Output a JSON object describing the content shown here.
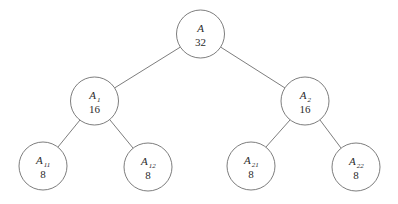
{
  "diagram": {
    "type": "binary-tree",
    "title": "",
    "background_color": "#ffffff",
    "stroke_color": "#6e6e6e",
    "text_color": "#2b2b2b",
    "nodes": [
      {
        "id": "root",
        "label": "A",
        "subscript": "",
        "value": "32",
        "cx": 200.5,
        "cy": 34,
        "r": 24
      },
      {
        "id": "a1",
        "label": "A",
        "subscript": "1",
        "value": "16",
        "cx": 94.5,
        "cy": 101,
        "r": 24
      },
      {
        "id": "a2",
        "label": "A",
        "subscript": "2",
        "value": "16",
        "cx": 305,
        "cy": 101,
        "r": 24
      },
      {
        "id": "a11",
        "label": "A",
        "subscript": "11",
        "value": "8",
        "cx": 43,
        "cy": 166,
        "r": 24
      },
      {
        "id": "a12",
        "label": "A",
        "subscript": "12",
        "value": "8",
        "cx": 148,
        "cy": 167,
        "r": 24
      },
      {
        "id": "a21",
        "label": "A",
        "subscript": "21",
        "value": "8",
        "cx": 251,
        "cy": 166,
        "r": 24
      },
      {
        "id": "a22",
        "label": "A",
        "subscript": "22",
        "value": "8",
        "cx": 356,
        "cy": 167,
        "r": 24
      }
    ],
    "edges": [
      {
        "id": "edge-root-a1",
        "from": "root",
        "to": "a1",
        "x1": 180.5,
        "y1": 47,
        "x2": 114.5,
        "y2": 88
      },
      {
        "id": "edge-root-a2",
        "from": "root",
        "to": "a2",
        "x1": 220.5,
        "y1": 47,
        "x2": 285,
        "y2": 88
      },
      {
        "id": "edge-a1-a11",
        "from": "a1",
        "to": "a11",
        "x1": 80,
        "y1": 120,
        "x2": 58,
        "y2": 147
      },
      {
        "id": "edge-a1-a12",
        "from": "a1",
        "to": "a12",
        "x1": 110,
        "y1": 120,
        "x2": 133,
        "y2": 148
      },
      {
        "id": "edge-a2-a21",
        "from": "a2",
        "to": "a21",
        "x1": 290,
        "y1": 120,
        "x2": 266,
        "y2": 147
      },
      {
        "id": "edge-a2-a22",
        "from": "a2",
        "to": "a22",
        "x1": 320,
        "y1": 120,
        "x2": 341,
        "y2": 148
      }
    ]
  }
}
